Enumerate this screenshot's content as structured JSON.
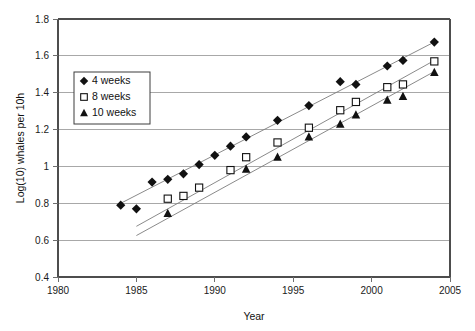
{
  "chart_data": {
    "type": "scatter",
    "title": "",
    "xlabel": "Year",
    "ylabel": "Log(10) whales per 10h",
    "xlim": [
      1980,
      2005
    ],
    "ylim": [
      0.4,
      1.8
    ],
    "xticks": [
      "1980",
      "1985",
      "1990",
      "1995",
      "2000",
      "2005"
    ],
    "xtick_values": [
      1980,
      1985,
      1990,
      1995,
      2000,
      2005
    ],
    "yticks": [
      "0.4",
      "0.6",
      "0.8",
      "1",
      "1.2",
      "1.4",
      "1.6",
      "1.8"
    ],
    "ytick_values": [
      0.4,
      0.6,
      0.8,
      1.0,
      1.2,
      1.4,
      1.6,
      1.8
    ],
    "grid": "horizontal",
    "legend_position": "upper-left-inside",
    "series": [
      {
        "name": "4 weeks",
        "marker": "filled-diamond",
        "color": "#111111",
        "points": [
          [
            1984,
            0.79
          ],
          [
            1985,
            0.77
          ],
          [
            1986,
            0.915
          ],
          [
            1987,
            0.93
          ],
          [
            1988,
            0.96
          ],
          [
            1989,
            1.01
          ],
          [
            1990,
            1.06
          ],
          [
            1991,
            1.11
          ],
          [
            1992,
            1.16
          ],
          [
            1994,
            1.25
          ],
          [
            1996,
            1.33
          ],
          [
            1998,
            1.46
          ],
          [
            1999,
            1.445
          ],
          [
            2001,
            1.545
          ],
          [
            2002,
            1.575
          ],
          [
            2004,
            1.675
          ]
        ],
        "trendline": [
          [
            1984,
            0.8
          ],
          [
            2004,
            1.675
          ]
        ]
      },
      {
        "name": "8 weeks",
        "marker": "open-square",
        "color": "#111111",
        "points": [
          [
            1987,
            0.825
          ],
          [
            1988,
            0.84
          ],
          [
            1989,
            0.885
          ],
          [
            1991,
            0.98
          ],
          [
            1992,
            1.05
          ],
          [
            1994,
            1.13
          ],
          [
            1996,
            1.21
          ],
          [
            1998,
            1.305
          ],
          [
            1999,
            1.35
          ],
          [
            2001,
            1.43
          ],
          [
            2002,
            1.445
          ],
          [
            2004,
            1.57
          ]
        ],
        "trendline": [
          [
            1985,
            0.675
          ],
          [
            2004,
            1.575
          ]
        ]
      },
      {
        "name": "10 weeks",
        "marker": "filled-triangle",
        "color": "#111111",
        "points": [
          [
            1987,
            0.745
          ],
          [
            1992,
            0.985
          ],
          [
            1994,
            1.05
          ],
          [
            1996,
            1.16
          ],
          [
            1998,
            1.23
          ],
          [
            1999,
            1.28
          ],
          [
            2001,
            1.36
          ],
          [
            2002,
            1.38
          ],
          [
            2004,
            1.51
          ]
        ],
        "trendline": [
          [
            1985,
            0.625
          ],
          [
            2004,
            1.515
          ]
        ]
      }
    ]
  },
  "legend": {
    "entries": [
      {
        "label": "4 weeks",
        "marker": "filled-diamond"
      },
      {
        "label": "8 weeks",
        "marker": "open-square"
      },
      {
        "label": "10 weeks",
        "marker": "filled-triangle"
      }
    ]
  },
  "colors": {
    "background": "#ffffff",
    "gridline": "#a8a8a8",
    "axis": "#4d4d4d",
    "marker": "#111111",
    "trendline": "#7d7d7d",
    "text": "#111111"
  }
}
